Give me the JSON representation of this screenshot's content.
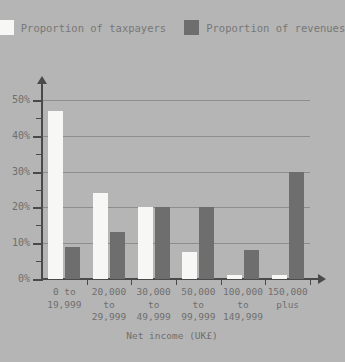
{
  "top_caption": "",
  "legend": {
    "items": [
      {
        "label": "Proportion of taxpayers",
        "color": "#f7f7f5",
        "key": "taxpayers"
      },
      {
        "label": "Proportion of revenues",
        "color": "#6e6e6e",
        "key": "revenues"
      }
    ]
  },
  "axis": {
    "x_title": "Net income (UK£)",
    "y_labels": [
      "0%",
      "10%",
      "20%",
      "30%",
      "40%",
      "50%"
    ]
  },
  "chart_data": {
    "type": "bar",
    "title": "",
    "subtitle": "",
    "xlabel": "Net income (UK£)",
    "ylabel": "",
    "ylim": [
      0,
      50
    ],
    "ytick_values": [
      0,
      10,
      20,
      30,
      40,
      50
    ],
    "ytick_labels": [
      "0%",
      "10%",
      "20%",
      "30%",
      "40%",
      "50%"
    ],
    "yminor_step": 5,
    "grid": true,
    "grid_axis": "y",
    "legend_position": "top-center",
    "background_color": "#b5b5b5",
    "grid_color": "#8d8d8d",
    "axis_color": "#4a4a4a",
    "text_color": "#6f6f6f",
    "categories": [
      "0 to\n19,999",
      "20,000\nto\n29,999",
      "30,000\nto\n49,999",
      "50,000\nto\n99,999",
      "100,000\nto\n149,999",
      "150,000\nplus"
    ],
    "series": [
      {
        "name": "Proportion of taxpayers",
        "color": "#f7f7f5",
        "values": [
          47,
          24,
          20,
          7.5,
          1,
          1
        ]
      },
      {
        "name": "Proportion of revenues",
        "color": "#6e6e6e",
        "values": [
          9,
          13,
          20,
          20,
          8,
          30
        ]
      }
    ]
  }
}
